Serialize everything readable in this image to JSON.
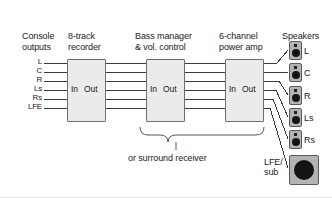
{
  "diagram": {
    "headers": [
      {
        "id": "console",
        "text": "Console\noutputs",
        "x": 22,
        "y": 31
      },
      {
        "id": "recorder",
        "text": "8-track\nrecorder",
        "x": 68,
        "y": 31
      },
      {
        "id": "bass-manager",
        "text": "Bass manager\n& vol. control",
        "x": 135,
        "y": 31
      },
      {
        "id": "power-amp",
        "text": "6-channel\npower amp",
        "x": 219,
        "y": 31
      },
      {
        "id": "speakers",
        "text": "Speakers",
        "x": 282,
        "y": 31
      }
    ],
    "channels": [
      {
        "label": "L",
        "y": 63
      },
      {
        "label": "C",
        "y": 72
      },
      {
        "label": "R",
        "y": 81
      },
      {
        "label": "Ls",
        "y": 90
      },
      {
        "label": "Rs",
        "y": 99
      },
      {
        "label": "LFE",
        "y": 108
      }
    ],
    "units": [
      {
        "id": "recorder-unit",
        "x": 67,
        "y": 59,
        "w": 39,
        "h": 63,
        "in_label": "In",
        "out_label": "Out"
      },
      {
        "id": "bass-manager-unit",
        "x": 146,
        "y": 59,
        "w": 39,
        "h": 63,
        "in_label": "In",
        "out_label": "Out"
      },
      {
        "id": "power-amp-unit",
        "x": 225,
        "y": 59,
        "w": 39,
        "h": 63,
        "in_label": "In",
        "out_label": "Out"
      }
    ],
    "brace": {
      "label": "or surround receiver",
      "label_x": 128,
      "label_y": 158
    },
    "speakers": [
      {
        "label": "L",
        "x": 289,
        "y": 41
      },
      {
        "label": "C",
        "x": 289,
        "y": 63
      },
      {
        "label": "R",
        "x": 289,
        "y": 86
      },
      {
        "label": "Ls",
        "x": 289,
        "y": 108
      },
      {
        "label": "Rs",
        "x": 289,
        "y": 130
      }
    ],
    "subwoofer": {
      "label": "LFE/\nsub",
      "label_x": 264,
      "label_y": 158,
      "x": 289,
      "y": 155
    },
    "colors": {
      "background": "#ffffff",
      "wire": "#3a3a3a",
      "box_fill": "#ebebeb",
      "box_stroke": "#6f6f6f",
      "speaker_fill": "#b3b3b3",
      "speaker_stroke": "#5a5a5a",
      "driver": "#141414",
      "text": "#1a1a1a"
    }
  }
}
